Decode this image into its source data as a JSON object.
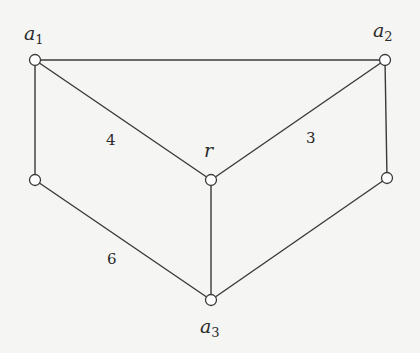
{
  "diagram": {
    "type": "weighted-graph",
    "colors": {
      "background": "#f5f5f3",
      "stroke": "#3a3a3a",
      "node_fill": "#ffffff",
      "text": "#2a2a2a"
    },
    "vertices": [
      {
        "id": "a1",
        "name": "a",
        "sub": "1",
        "x": 35,
        "y": 60
      },
      {
        "id": "a2",
        "name": "a",
        "sub": "2",
        "x": 385,
        "y": 60
      },
      {
        "id": "r",
        "name": "r",
        "sub": "",
        "x": 211,
        "y": 180
      },
      {
        "id": "b1",
        "name": "",
        "sub": "",
        "x": 35,
        "y": 180
      },
      {
        "id": "b2",
        "name": "",
        "sub": "",
        "x": 387,
        "y": 178
      },
      {
        "id": "a3",
        "name": "a",
        "sub": "3",
        "x": 211,
        "y": 300
      }
    ],
    "edges": [
      {
        "from": "a1",
        "to": "a2",
        "weight": ""
      },
      {
        "from": "a1",
        "to": "r",
        "weight": "4"
      },
      {
        "from": "a2",
        "to": "r",
        "weight": "3"
      },
      {
        "from": "a1",
        "to": "b1",
        "weight": ""
      },
      {
        "from": "a2",
        "to": "b2",
        "weight": ""
      },
      {
        "from": "b1",
        "to": "a3",
        "weight": "6"
      },
      {
        "from": "r",
        "to": "a3",
        "weight": ""
      },
      {
        "from": "b2",
        "to": "a3",
        "weight": ""
      }
    ],
    "labels": {
      "a1": {
        "main": "a",
        "sub": "1"
      },
      "a2": {
        "main": "a",
        "sub": "2"
      },
      "r": {
        "main": "r"
      },
      "a3": {
        "main": "a",
        "sub": "3"
      }
    },
    "edge_labels": {
      "a1_r": "4",
      "a2_r": "3",
      "b1_a3": "6"
    }
  }
}
